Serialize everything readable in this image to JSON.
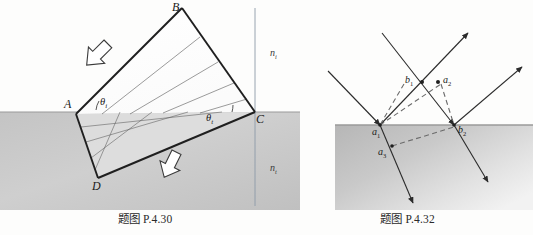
{
  "page": {
    "width": 533,
    "height": 235,
    "background_color": "#fdfdfc",
    "top_cut_text": "",
    "ink_color": "#1f1f1f",
    "medium_fill_color": "#c9c9c9",
    "dashed_color": "#6b6b6b"
  },
  "figures": [
    {
      "id": "P.4.30",
      "caption": "题图 P.4.30",
      "description": "Refraction of a wide collimated beam at a plane interface; parallelogram beam ABCD crossing boundary",
      "vertex_labels": [
        {
          "name": "A",
          "text": "A"
        },
        {
          "name": "B",
          "text": "B"
        },
        {
          "name": "C",
          "text": "C"
        },
        {
          "name": "D",
          "text": "D"
        }
      ],
      "angle_labels": [
        {
          "name": "theta-i",
          "base": "θ",
          "sub": "i"
        },
        {
          "name": "theta-t",
          "base": "θ",
          "sub": "t"
        }
      ],
      "index_labels": [
        {
          "name": "n1",
          "base": "n",
          "sub": "i"
        },
        {
          "name": "n2",
          "base": "n",
          "sub": "t"
        }
      ],
      "arrows": [
        {
          "name": "incident-beam-arrow",
          "direction": "down-right"
        },
        {
          "name": "transmitted-beam-arrow",
          "direction": "down-right"
        }
      ]
    },
    {
      "id": "P.4.32",
      "caption": "题图 P.4.32",
      "description": "Two parallel rays reflecting and refracting at a plane interface; wavefront construction with dashed lines",
      "point_labels": [
        {
          "name": "a1",
          "base": "a",
          "sub": "1"
        },
        {
          "name": "b1",
          "base": "b",
          "sub": "1"
        },
        {
          "name": "a2",
          "base": "a",
          "sub": "2"
        },
        {
          "name": "b2",
          "base": "b",
          "sub": "2"
        },
        {
          "name": "a3",
          "base": "a",
          "sub": "3"
        }
      ]
    }
  ]
}
